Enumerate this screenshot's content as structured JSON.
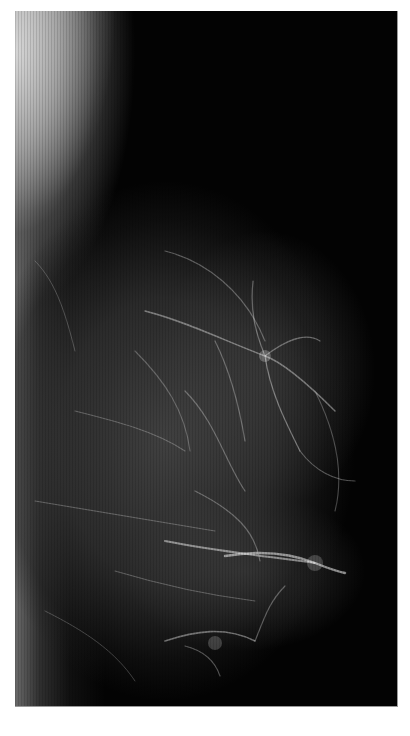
{
  "image": {
    "subject": "mammogram-radiograph",
    "view": "mediolateral",
    "background_color": "#ffffff",
    "film_color": "#030303",
    "tissue_highlight_color": "#d8d8d8",
    "text_labels": []
  }
}
